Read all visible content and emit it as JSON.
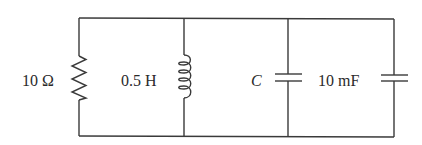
{
  "diagram": {
    "type": "circuit-schematic",
    "topology": "four elements in parallel between top and bottom rails",
    "colors": {
      "wire": "#3a3a3a",
      "text": "#2a2a2a",
      "background": "#ffffff"
    },
    "components": [
      {
        "id": "resistor",
        "kind": "resistor",
        "label": "10 Ω",
        "value": 10,
        "unit": "Ω"
      },
      {
        "id": "inductor",
        "kind": "inductor",
        "label": "0.5 H",
        "value": 0.5,
        "unit": "H"
      },
      {
        "id": "capacitor-c",
        "kind": "capacitor",
        "label": "C",
        "value": null,
        "unit": "F"
      },
      {
        "id": "capacitor-10mf",
        "kind": "capacitor",
        "label": "10 mF",
        "value": 10,
        "unit": "mF"
      }
    ]
  }
}
